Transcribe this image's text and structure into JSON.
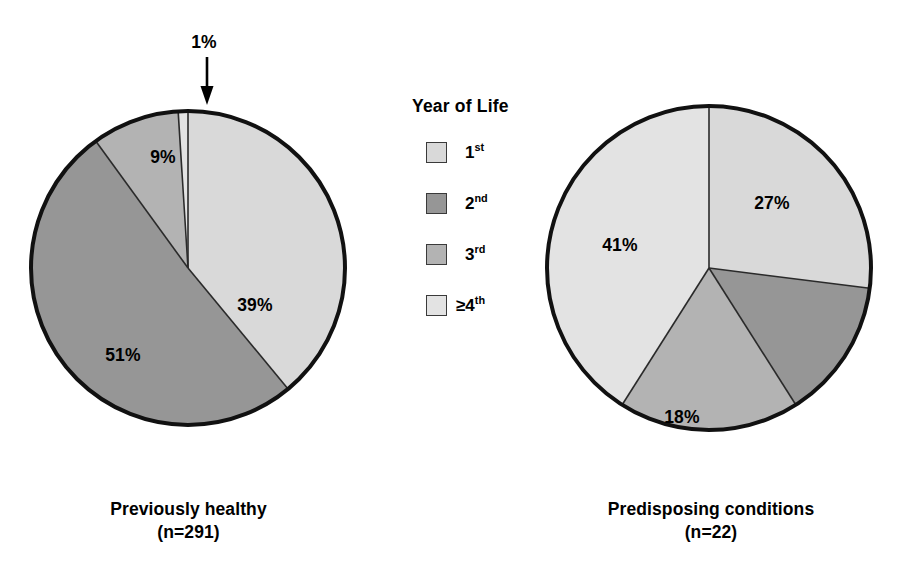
{
  "figure": {
    "background_color": "#ffffff",
    "legend": {
      "title": "Year of Life",
      "items": [
        {
          "label_main": "1",
          "label_sup": "st",
          "color": "#d9d9d9"
        },
        {
          "label_main": "2",
          "label_sup": "nd",
          "color": "#969696"
        },
        {
          "label_main": "3",
          "label_sup": "rd",
          "color": "#b3b3b3"
        },
        {
          "label_main": "≥4",
          "label_sup": "th",
          "color": "#e3e3e3"
        }
      ]
    },
    "annotation": {
      "callout_text": "1%",
      "arrow_icon": "down-arrow-icon"
    }
  },
  "chart_data": [
    {
      "type": "pie",
      "name": "previously-healthy",
      "title": "Previously healthy",
      "subtitle": "(n=291)",
      "n": 291,
      "start_angle_deg": 0,
      "direction": "clockwise",
      "categories": [
        "1st",
        "2nd",
        "3rd",
        "≥4th"
      ],
      "values": [
        39,
        51,
        9,
        1
      ],
      "value_labels": [
        "39%",
        "51%",
        "9%",
        "1%"
      ],
      "colors": [
        "#d9d9d9",
        "#969696",
        "#b3b3b3",
        "#e3e3e3"
      ],
      "label_positions": [
        {
          "x": 255,
          "y": 305
        },
        {
          "x": 123,
          "y": 355
        },
        {
          "x": 163,
          "y": 157
        },
        {
          "x": 204,
          "y": 40
        }
      ],
      "labels_shown": [
        true,
        true,
        true,
        true
      ],
      "callout": true
    },
    {
      "type": "pie",
      "name": "predisposing-conditions",
      "title": "Predisposing conditions",
      "subtitle": "(n=22)",
      "n": 22,
      "start_angle_deg": 0,
      "direction": "clockwise",
      "categories": [
        "1st",
        "2nd",
        "3rd",
        "≥4th"
      ],
      "values": [
        27,
        14,
        18,
        41
      ],
      "value_labels": [
        "27%",
        "",
        "18%",
        "41%"
      ],
      "colors": [
        "#d9d9d9",
        "#969696",
        "#b3b3b3",
        "#e3e3e3"
      ],
      "label_positions": [
        {
          "x": 772,
          "y": 203
        },
        {
          "x": 0,
          "y": 0
        },
        {
          "x": 682,
          "y": 417
        },
        {
          "x": 620,
          "y": 245
        }
      ],
      "labels_shown": [
        true,
        false,
        true,
        true
      ],
      "callout": false
    }
  ]
}
